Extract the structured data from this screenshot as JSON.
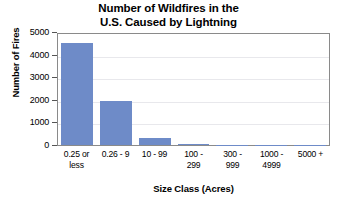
{
  "chart_data": {
    "type": "bar",
    "title": "Number of Wildfires in the U.S. Caused by Lightning",
    "title_lines": [
      "Number of Wildfires in the",
      "U.S. Caused by Lightning"
    ],
    "xlabel": "Size Class (Acres)",
    "ylabel": "Number of Fires",
    "categories": [
      "0.25 or less",
      "0.26 - 9",
      "10 - 99",
      "100 - 299",
      "300 - 999",
      "1000 - 4999",
      "5000 +"
    ],
    "category_lines": [
      [
        "0.25 or",
        "less"
      ],
      [
        "0.26 - 9",
        ""
      ],
      [
        "10 - 99",
        ""
      ],
      [
        "100 -",
        "299"
      ],
      [
        "300 -",
        "999"
      ],
      [
        "1000 -",
        "4999"
      ],
      [
        "5000 +",
        ""
      ]
    ],
    "values": [
      4600,
      2000,
      320,
      30,
      20,
      15,
      5
    ],
    "ylim": [
      0,
      5000
    ],
    "yticks": [
      0,
      1000,
      2000,
      3000,
      4000,
      5000
    ],
    "ytick_labels": [
      "0",
      "1000",
      "2000",
      "3000",
      "4000",
      "5000"
    ],
    "grid": true,
    "grid_axis": "y",
    "legend": "none",
    "bar_color": "#6e8bc8",
    "plot_border_color": "#8a8a8a",
    "gridline_color": "#e8e8ec",
    "background_color": "#ffffff"
  }
}
